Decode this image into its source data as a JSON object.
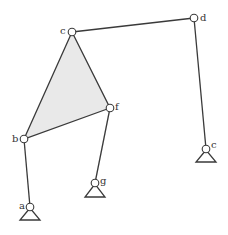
{
  "diagram": {
    "type": "planar-linkage",
    "joints": [
      {
        "id": "a",
        "label": "a",
        "x": 30,
        "y": 207,
        "ground": true
      },
      {
        "id": "b",
        "label": "b",
        "x": 24,
        "y": 139,
        "ground": false
      },
      {
        "id": "c",
        "label": "c",
        "x": 72,
        "y": 32,
        "ground": false
      },
      {
        "id": "d",
        "label": "d",
        "x": 194,
        "y": 18,
        "ground": false
      },
      {
        "id": "e",
        "label": "c",
        "x": 206,
        "y": 149,
        "ground": true
      },
      {
        "id": "f",
        "label": "f",
        "x": 110,
        "y": 108,
        "ground": false
      },
      {
        "id": "g",
        "label": "g",
        "x": 95,
        "y": 183,
        "ground": true
      }
    ],
    "rigid_body": {
      "name": "ternary-link-bcf",
      "vertices": [
        "b",
        "c",
        "f"
      ],
      "fill": "#e9e9e9"
    },
    "links": [
      {
        "from": "a",
        "to": "b"
      },
      {
        "from": "c",
        "to": "d"
      },
      {
        "from": "d",
        "to": "e"
      },
      {
        "from": "f",
        "to": "g"
      }
    ],
    "colors": {
      "stroke": "#3a3a3a",
      "fill": "#e9e9e9",
      "background": "#ffffff"
    }
  }
}
